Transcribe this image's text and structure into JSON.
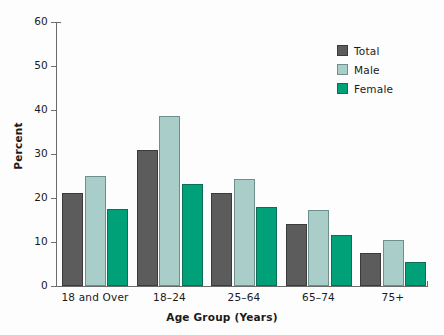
{
  "chart_data": {
    "type": "bar",
    "title": "",
    "xlabel": "Age Group (Years)",
    "ylabel": "Percent",
    "categories": [
      "18 and Over",
      "18–24",
      "25–64",
      "65–74",
      "75+"
    ],
    "series": [
      {
        "name": "Total",
        "color": "#5c5c5c",
        "values": [
          21.2,
          31.0,
          21.2,
          14.2,
          7.6
        ]
      },
      {
        "name": "Male",
        "color": "#a9ceca",
        "values": [
          25.1,
          38.7,
          24.4,
          17.2,
          10.5
        ]
      },
      {
        "name": "Female",
        "color": "#00a178",
        "values": [
          17.4,
          23.1,
          18.0,
          11.5,
          5.5
        ]
      }
    ],
    "ylim": [
      0,
      60
    ],
    "yticks": [
      0,
      10,
      20,
      30,
      40,
      50,
      60
    ],
    "ytick_labels": [
      "0",
      "10",
      "20",
      "30",
      "40",
      "50",
      "60"
    ],
    "grid": false,
    "legend_position": "top-right",
    "legend": [
      "Total",
      "Male",
      "Female"
    ]
  }
}
